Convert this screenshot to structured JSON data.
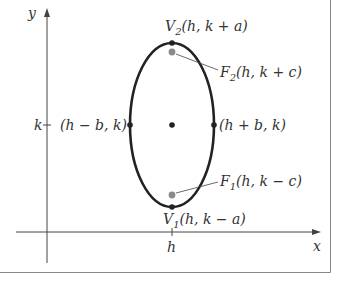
{
  "diagram": {
    "axes": {
      "x_label": "x",
      "y_label": "y",
      "x_tick_label": "h",
      "y_tick_label": "k"
    },
    "points": {
      "v2": {
        "name": "V",
        "sub": "2",
        "coords": "(h, k + a)"
      },
      "f2": {
        "name": "F",
        "sub": "2",
        "coords": "(h, k + c)"
      },
      "left": {
        "coords": "(h − b, k)"
      },
      "right": {
        "coords": "(h + b, k)"
      },
      "f1": {
        "name": "F",
        "sub": "1",
        "coords": "(h, k − c)"
      },
      "v1": {
        "name": "V",
        "sub": "1",
        "coords": "(h, k − a)"
      }
    },
    "colors": {
      "ellipse": "#222222",
      "vertex_point": "#222222",
      "focus_point": "#8a8a8a",
      "axis": "#444444",
      "frame": "#888888",
      "text": "#333333"
    }
  }
}
